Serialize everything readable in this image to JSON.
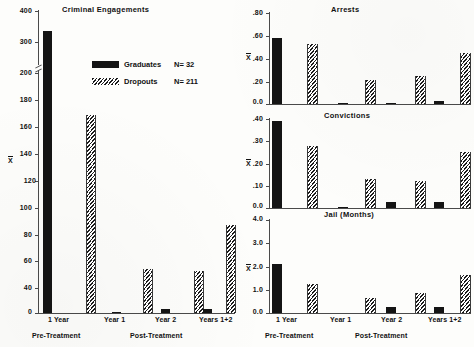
{
  "figure": {
    "legend": {
      "graduates_label": "Graduates",
      "graduates_n": "N= 32",
      "dropouts_label": "Dropouts",
      "dropouts_n": "N= 211"
    },
    "axis_symbol": "X",
    "group_labels": [
      "1 Year",
      "Year 1",
      "Year 2",
      "Years 1+2"
    ],
    "phase_labels": {
      "pre": "Pre-Treatment",
      "post": "Post-Treatment"
    }
  },
  "chart_data": [
    {
      "type": "bar",
      "title": "Criminal Engagements",
      "panel": "left",
      "xlabel": "",
      "ylabel": "X",
      "categories": [
        "1 Year",
        "Year 1",
        "Year 2",
        "Years 1+2"
      ],
      "series": [
        {
          "name": "Graduates",
          "values": [
            335,
            1,
            3,
            3
          ]
        },
        {
          "name": "Dropouts",
          "values": [
            165,
            37,
            35,
            73
          ]
        }
      ],
      "ylim": [
        0,
        400
      ],
      "yticks": [
        0,
        20,
        40,
        60,
        80,
        100,
        120,
        140,
        160,
        180,
        200,
        300,
        400
      ],
      "ytick_labels": [
        "0",
        "20",
        "40",
        "60",
        "80",
        "100",
        "120",
        "140",
        "160",
        "180",
        "200",
        "300",
        "400"
      ],
      "axis_break": {
        "between": [
          200,
          300
        ],
        "note": "scale compresses above 200"
      },
      "grid": false,
      "legend_position": "upper-center"
    },
    {
      "type": "bar",
      "title": "Arrests",
      "panel": "right-top",
      "xlabel": "",
      "ylabel": "X",
      "categories": [
        "1 Year",
        "Year 1",
        "Year 2",
        "Years 1+2"
      ],
      "series": [
        {
          "name": "Graduates",
          "values": [
            0.58,
            0.01,
            0.01,
            0.03
          ]
        },
        {
          "name": "Dropouts",
          "values": [
            0.53,
            0.21,
            0.25,
            0.45
          ]
        }
      ],
      "ylim": [
        0.0,
        0.8
      ],
      "yticks": [
        0.0,
        0.2,
        0.4,
        0.6,
        0.8
      ],
      "ytick_labels": [
        "0.0",
        ".20",
        ".40",
        ".60",
        ".80"
      ],
      "grid": false
    },
    {
      "type": "bar",
      "title": "Convictions",
      "panel": "right-middle",
      "xlabel": "",
      "ylabel": "X",
      "categories": [
        "1 Year",
        "Year 1",
        "Year 2",
        "Years 1+2"
      ],
      "series": [
        {
          "name": "Graduates",
          "values": [
            0.39,
            0.005,
            0.025,
            0.025
          ]
        },
        {
          "name": "Dropouts",
          "values": [
            0.28,
            0.13,
            0.12,
            0.25
          ]
        }
      ],
      "ylim": [
        0.0,
        0.4
      ],
      "yticks": [
        0.0,
        0.1,
        0.2,
        0.3,
        0.4
      ],
      "ytick_labels": [
        "0.0",
        ".10",
        ".20",
        ".30",
        ".40"
      ],
      "grid": false
    },
    {
      "type": "bar",
      "title": "Jail (Months)",
      "panel": "right-bottom",
      "xlabel": "",
      "ylabel": "X",
      "categories": [
        "1 Year",
        "Year 1",
        "Year 2",
        "Years 1+2"
      ],
      "series": [
        {
          "name": "Graduates",
          "values": [
            2.1,
            0.0,
            0.28,
            0.28
          ]
        },
        {
          "name": "Dropouts",
          "values": [
            1.25,
            0.65,
            0.88,
            1.62
          ]
        }
      ],
      "ylim": [
        0.0,
        4.0
      ],
      "yticks": [
        0.0,
        1.0,
        2.0,
        3.0,
        4.0
      ],
      "ytick_labels": [
        "0.0",
        "1.0",
        "2.0",
        "3.0",
        "4.0"
      ],
      "grid": false
    }
  ]
}
